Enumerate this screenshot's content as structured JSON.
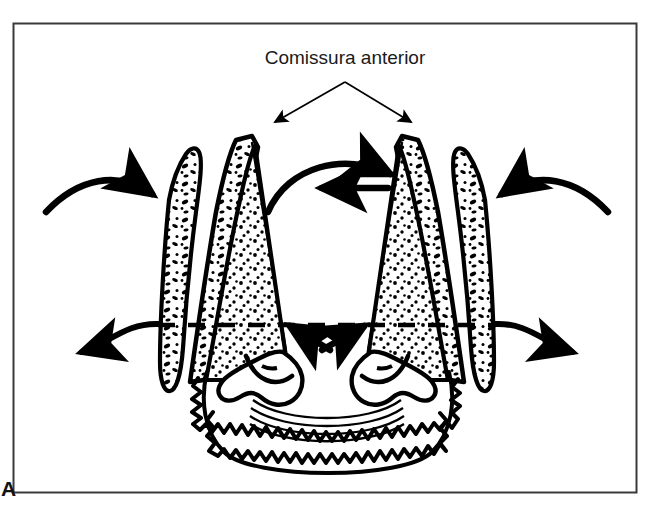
{
  "figure": {
    "panel_label": "A",
    "label_text": "Comissura anterior",
    "background_color": "#ffffff",
    "ink_color": "#000000",
    "frame_color": "#3a3a3a",
    "frame": {
      "x": 13,
      "y": 23,
      "width": 624,
      "height": 470
    },
    "label_position": {
      "x": 345,
      "y": 60
    },
    "leader": {
      "apex": {
        "x": 345,
        "y": 80
      },
      "arrow_left": {
        "x": 268,
        "y": 128
      },
      "arrow_right": {
        "x": 418,
        "y": 128
      }
    },
    "annotations": [
      {
        "name": "comissura-anterior-label",
        "text": "Comissura anterior"
      },
      {
        "name": "panel-letter",
        "text": "A"
      }
    ],
    "structures": [
      {
        "name": "left-vocal-fold",
        "fill": "stipple"
      },
      {
        "name": "right-vocal-fold",
        "fill": "stipple"
      },
      {
        "name": "left-vestibular-fold",
        "fill": "mottled"
      },
      {
        "name": "right-vestibular-fold",
        "fill": "mottled"
      },
      {
        "name": "left-arytenoid-cartilage",
        "fill": "white"
      },
      {
        "name": "right-arytenoid-cartilage",
        "fill": "white"
      },
      {
        "name": "cricoid-cartilage",
        "fill": "white"
      },
      {
        "name": "posterior-commissure-bands",
        "fill": "white"
      }
    ],
    "motion_arrows": [
      {
        "name": "arrow-left-inward",
        "direction": "inward-right"
      },
      {
        "name": "arrow-right-inward",
        "direction": "inward-left"
      },
      {
        "name": "arrow-left-outward",
        "direction": "outward-left"
      },
      {
        "name": "arrow-right-outward",
        "direction": "outward-right"
      },
      {
        "name": "arrow-center-arch-right",
        "direction": "right"
      },
      {
        "name": "arrow-center-horizontal-left",
        "direction": "left"
      },
      {
        "name": "arrow-center-lower-left",
        "direction": "left"
      },
      {
        "name": "arrow-center-lower-right",
        "direction": "right"
      }
    ],
    "midline": {
      "name": "glottic-level-dashed-line",
      "y": 325,
      "style": "dashed"
    }
  }
}
